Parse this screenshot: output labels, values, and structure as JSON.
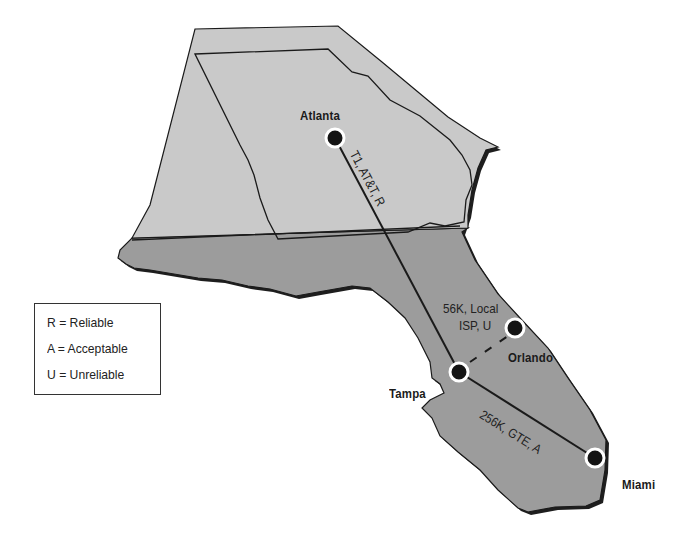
{
  "map": {
    "colors": {
      "georgia_fill": "#c9c9c9",
      "florida_fill": "#9c9c9c",
      "shadow": "#1e1e1e",
      "outline": "#1a1a1a",
      "link_line": "#1a1a1a",
      "node_fill": "#141414",
      "node_ring": "#ffffff"
    },
    "cities": [
      {
        "id": "atlanta",
        "name": "Atlanta",
        "x": 335,
        "y": 138
      },
      {
        "id": "orlando",
        "name": "Orlando",
        "x": 515,
        "y": 328
      },
      {
        "id": "tampa",
        "name": "Tampa",
        "x": 459,
        "y": 372
      },
      {
        "id": "miami",
        "name": "Miami",
        "x": 595,
        "y": 458
      }
    ],
    "links": [
      {
        "from": "Atlanta",
        "to": "Tampa",
        "label": "T1, AT&T, R",
        "style": "solid"
      },
      {
        "from": "Tampa",
        "to": "Orlando",
        "label_line1": "56K, Local",
        "label_line2": "ISP, U",
        "style": "dashed"
      },
      {
        "from": "Tampa",
        "to": "Miami",
        "label": "256K, GTE, A",
        "style": "solid"
      }
    ]
  },
  "legend": {
    "items": [
      {
        "label": "R = Reliable"
      },
      {
        "label": "A = Acceptable"
      },
      {
        "label": "U = Unreliable"
      }
    ]
  }
}
